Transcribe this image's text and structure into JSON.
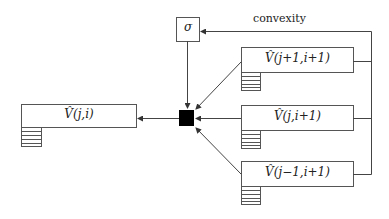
{
  "diagram": {
    "sigma_label": "σ",
    "convexity_label": "convexity",
    "nodes": {
      "target": "V̂(j,i)",
      "upper": "V̂(j+1,i+1)",
      "middle": "V̂(j,i+1)",
      "lower": "V̂(j−1,i+1)"
    },
    "colors": {
      "line": "#333333",
      "combiner": "#000000"
    }
  }
}
